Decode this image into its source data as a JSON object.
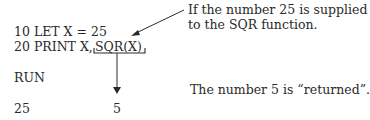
{
  "code": {
    "line1": "10 LET X = 25",
    "line2_prefix": "20 PRINT X,",
    "line2_func": "SQR(X)",
    "run": "RUN",
    "output_left": "25",
    "output_right": "5"
  },
  "annotations": {
    "top_line1": "If the number 25 is supplied",
    "top_line2": "to the SQR function.",
    "bottom": "The number 5 is “returned”."
  }
}
